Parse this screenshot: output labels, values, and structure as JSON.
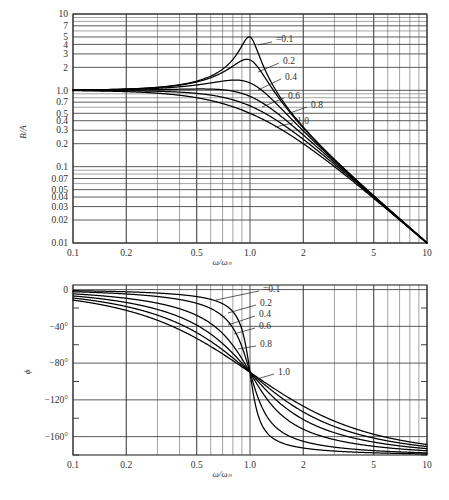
{
  "figure": {
    "title": "",
    "background": "#ffffff",
    "curve_color": "#000000",
    "grid_color": "#3d3d3d"
  },
  "panels": {
    "magnitude": {
      "ylabel": "B/A",
      "xlabel": "ω/ωₙ",
      "x_tick_labels": [
        "0.1",
        "0.2",
        "0.5",
        "1.0",
        "2",
        "5",
        "10"
      ],
      "y_tick_labels": [
        "10",
        "7",
        "5",
        "4",
        "3",
        "2",
        "1.0",
        "0.7",
        "0.5",
        "0.4",
        "0.3",
        "0.2",
        "0.1",
        "0.07",
        "0.05",
        "0.04",
        "0.03",
        "0.02",
        "0.01"
      ],
      "curve_labels": [
        "=0.1",
        "0.2",
        "0.4",
        "0.6",
        "0.8",
        "1.0"
      ]
    },
    "phase": {
      "ylabel": "ϕ",
      "xlabel": "ω/ωₙ",
      "x_tick_labels": [
        "0.1",
        "0.2",
        "0.5",
        "1.0",
        "2",
        "5",
        "10"
      ],
      "y_tick_labels": [
        "0",
        "−40°",
        "−80°",
        "−120°",
        "−160°"
      ],
      "curve_labels": [
        "=0.1",
        "0.2",
        "0.4",
        "0.6",
        "0.8",
        "1.0"
      ]
    }
  },
  "chart_data": [
    {
      "type": "line",
      "title": "Amplitude ratio of driven damped harmonic oscillator",
      "xlabel": "ω/ωₙ",
      "ylabel": "B/A",
      "xscale": "log",
      "yscale": "log",
      "xlim": [
        0.1,
        10
      ],
      "ylim": [
        0.01,
        10
      ],
      "grid": true,
      "legend": "inline curve labels at right of each curve",
      "x_ticks": [
        0.1,
        0.2,
        0.5,
        1.0,
        2,
        5,
        10
      ],
      "y_ticks": [
        10,
        7,
        5,
        4,
        3,
        2,
        1.0,
        0.7,
        0.5,
        0.4,
        0.3,
        0.2,
        0.1,
        0.07,
        0.05,
        0.04,
        0.03,
        0.02,
        0.01
      ],
      "formula": "B/A = 1/sqrt((1-r^2)^2 + (2*zeta*r)^2)",
      "series": [
        {
          "name": "=0.1",
          "zeta": 0.1,
          "peak_x": 0.99,
          "peak_y": 5.03,
          "x": [
            0.1,
            0.2,
            0.3,
            0.5,
            0.7,
            0.8,
            0.9,
            0.95,
            1.0,
            1.05,
            1.1,
            1.2,
            1.5,
            2,
            3,
            5,
            10
          ],
          "values": [
            1.01,
            1.04,
            1.1,
            1.33,
            1.92,
            2.68,
            4.02,
            4.78,
            5.0,
            4.42,
            3.25,
            1.95,
            0.79,
            0.33,
            0.125,
            0.0417,
            0.0101
          ]
        },
        {
          "name": "0.2",
          "zeta": 0.2,
          "peak_x": 0.96,
          "peak_y": 2.55,
          "x": [
            0.1,
            0.2,
            0.3,
            0.5,
            0.7,
            0.8,
            0.9,
            0.95,
            1.0,
            1.05,
            1.1,
            1.2,
            1.5,
            2,
            3,
            5,
            10
          ],
          "values": [
            1.01,
            1.04,
            1.09,
            1.3,
            1.76,
            2.16,
            2.47,
            2.5,
            2.5,
            2.32,
            2.02,
            1.53,
            0.74,
            0.32,
            0.124,
            0.0416,
            0.0101
          ]
        },
        {
          "name": "0.4",
          "zeta": 0.4,
          "peak_x": 0.82,
          "peak_y": 1.36,
          "x": [
            0.1,
            0.2,
            0.3,
            0.5,
            0.7,
            0.8,
            0.9,
            0.95,
            1.0,
            1.05,
            1.1,
            1.2,
            1.5,
            2,
            3,
            5,
            10
          ],
          "values": [
            1.0,
            1.03,
            1.07,
            1.19,
            1.33,
            1.36,
            1.32,
            1.28,
            1.25,
            1.2,
            1.15,
            1.02,
            0.62,
            0.3,
            0.122,
            0.0413,
            0.0101
          ]
        },
        {
          "name": "0.6",
          "zeta": 0.6,
          "peak_x": 0.6,
          "peak_y": 1.04,
          "x": [
            0.1,
            0.2,
            0.3,
            0.5,
            0.7,
            0.8,
            0.9,
            0.95,
            1.0,
            1.05,
            1.1,
            1.2,
            1.5,
            2,
            3,
            5,
            10
          ],
          "values": [
            1.0,
            1.02,
            1.04,
            1.04,
            0.99,
            0.94,
            0.88,
            0.86,
            0.83,
            0.81,
            0.78,
            0.72,
            0.52,
            0.28,
            0.118,
            0.0408,
            0.01
          ]
        },
        {
          "name": "0.8",
          "zeta": 0.8,
          "peak_x": 0.1,
          "peak_y": 1.0,
          "x": [
            0.1,
            0.2,
            0.3,
            0.5,
            0.7,
            0.8,
            0.9,
            0.95,
            1.0,
            1.05,
            1.1,
            1.2,
            1.5,
            2,
            3,
            5,
            10
          ],
          "values": [
            1.0,
            1.0,
            1.0,
            0.94,
            0.82,
            0.76,
            0.7,
            0.67,
            0.625,
            0.6,
            0.57,
            0.52,
            0.41,
            0.25,
            0.112,
            0.04,
            0.01
          ]
        },
        {
          "name": "1.0",
          "zeta": 1.0,
          "peak_x": 0.1,
          "peak_y": 0.99,
          "x": [
            0.1,
            0.2,
            0.3,
            0.5,
            0.7,
            0.8,
            0.9,
            0.95,
            1.0,
            1.05,
            1.1,
            1.2,
            1.5,
            2,
            3,
            5,
            10
          ],
          "values": [
            0.99,
            0.96,
            0.92,
            0.8,
            0.67,
            0.61,
            0.55,
            0.53,
            0.5,
            0.48,
            0.45,
            0.41,
            0.31,
            0.2,
            0.1,
            0.0385,
            0.0098
          ]
        }
      ]
    },
    {
      "type": "line",
      "title": "Phase of driven damped harmonic oscillator",
      "xlabel": "ω/ωₙ",
      "ylabel": "ϕ",
      "xscale": "log",
      "yscale": "linear",
      "xlim": [
        0.1,
        10
      ],
      "ylim": [
        -180,
        5
      ],
      "grid": true,
      "legend": "inline curve labels at right of each curve",
      "x_ticks": [
        0.1,
        0.2,
        0.5,
        1.0,
        2,
        5,
        10
      ],
      "y_ticks": [
        0,
        -40,
        -80,
        -120,
        -160
      ],
      "y_minor_ticks": [
        -20,
        -60,
        -100,
        -140,
        -180
      ],
      "formula": "phi = -atan2(2*zeta*r, 1-r^2)  [degrees]",
      "series": [
        {
          "name": "=0.1",
          "zeta": 0.1,
          "x": [
            0.1,
            0.2,
            0.5,
            0.8,
            0.9,
            1.0,
            1.1,
            1.2,
            2,
            5,
            10
          ],
          "values": [
            -1.2,
            -2.4,
            -7.6,
            -26.6,
            -43.5,
            -90,
            -136.3,
            -152.9,
            -172.4,
            -177.6,
            -178.8
          ]
        },
        {
          "name": "0.2",
          "zeta": 0.2,
          "x": [
            0.1,
            0.2,
            0.5,
            0.8,
            0.9,
            1.0,
            1.1,
            1.2,
            2,
            5,
            10
          ],
          "values": [
            -2.3,
            -4.8,
            -14.9,
            -41.6,
            -62.4,
            -90,
            -115.4,
            -131.4,
            -164.9,
            -175.2,
            -177.7
          ]
        },
        {
          "name": "0.4",
          "zeta": 0.4,
          "x": [
            0.1,
            0.2,
            0.5,
            0.8,
            0.9,
            1.0,
            1.1,
            1.2,
            2,
            5,
            10
          ],
          "values": [
            -4.6,
            -9.5,
            -28.1,
            -65.4,
            -76.5,
            -90,
            -103.3,
            -114.1,
            -151.9,
            -170.5,
            -175.4
          ]
        },
        {
          "name": "0.6",
          "zeta": 0.6,
          "x": [
            0.1,
            0.2,
            0.5,
            0.8,
            0.9,
            1.0,
            1.1,
            1.2,
            2,
            5,
            10
          ],
          "values": [
            -6.9,
            -14.3,
            -38.7,
            -71.6,
            -81.1,
            -90,
            -99.4,
            -108.4,
            -141.3,
            -166,
            -173.1
          ]
        },
        {
          "name": "0.8",
          "zeta": 0.8,
          "x": [
            0.1,
            0.2,
            0.5,
            0.8,
            0.9,
            1.0,
            1.1,
            1.2,
            2,
            5,
            10
          ],
          "values": [
            -9.2,
            -18.9,
            -46.8,
            -75.2,
            -83.1,
            -90,
            -97.5,
            -105,
            -133.2,
            -161.6,
            -170.8
          ]
        },
        {
          "name": "1.0",
          "zeta": 1.0,
          "x": [
            0.1,
            0.2,
            0.5,
            0.8,
            0.9,
            1.0,
            1.1,
            1.2,
            2,
            5,
            10
          ],
          "values": [
            -11.4,
            -23.4,
            -53.1,
            -77.3,
            -84.3,
            -90,
            -96.4,
            -102.7,
            -126.9,
            -157.4,
            -168.6
          ]
        }
      ]
    }
  ]
}
